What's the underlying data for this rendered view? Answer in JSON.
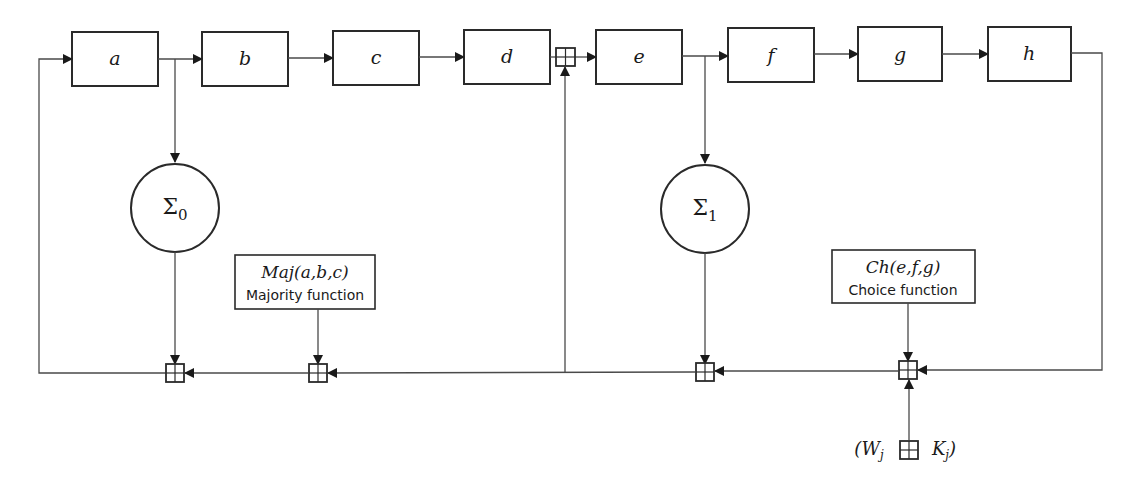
{
  "diagram": {
    "registers": [
      {
        "id": "a",
        "label": "a"
      },
      {
        "id": "b",
        "label": "b"
      },
      {
        "id": "c",
        "label": "c"
      },
      {
        "id": "d",
        "label": "d"
      },
      {
        "id": "e",
        "label": "e"
      },
      {
        "id": "f",
        "label": "f"
      },
      {
        "id": "g",
        "label": "g"
      },
      {
        "id": "h",
        "label": "h"
      }
    ],
    "sigma0": {
      "symbol": "Σ",
      "subscript": "0"
    },
    "sigma1": {
      "symbol": "Σ",
      "subscript": "1"
    },
    "majority": {
      "formula": "Maj(a,b,c)",
      "description": "Majority function"
    },
    "choice": {
      "formula": "Ch(e,f,g)",
      "description": "Choice function"
    },
    "schedule_input": {
      "w": "W",
      "w_sub": "j",
      "k": "K",
      "k_sub": "j",
      "open": "(",
      "close": ")"
    },
    "adder_symbol": "⊞",
    "colors": {
      "stroke": "#2a2a2a",
      "wire": "#4a4a4a",
      "background": "#ffffff"
    }
  }
}
